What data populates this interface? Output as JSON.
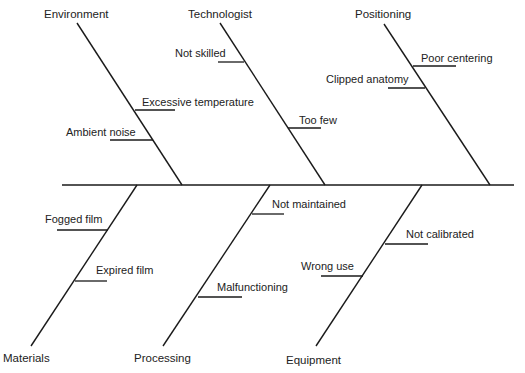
{
  "diagram": {
    "type": "fishbone",
    "line_color": "#1a1a1a",
    "spine": {
      "x1": 62,
      "y1": 185,
      "x2": 514,
      "y2": 185
    },
    "categories": [
      {
        "id": "environment",
        "label": "Environment",
        "side": "top",
        "label_pos": {
          "x": 44,
          "y": 8
        },
        "rib": {
          "x1": 77,
          "y1": 23,
          "x2": 182,
          "y2": 185
        },
        "causes": [
          {
            "label": "Excessive temperature",
            "label_pos": {
              "x": 142,
              "y": 96
            },
            "line": {
              "x1": 135,
              "y1": 110,
              "x2": 175,
              "y2": 110
            }
          },
          {
            "label": "Ambient noise",
            "label_pos": {
              "x": 66,
              "y": 126
            },
            "line": {
              "x1": 110,
              "y1": 140,
              "x2": 153,
              "y2": 140
            }
          }
        ]
      },
      {
        "id": "technologist",
        "label": "Technologist",
        "side": "top",
        "label_pos": {
          "x": 188,
          "y": 8
        },
        "rib": {
          "x1": 220,
          "y1": 23,
          "x2": 325,
          "y2": 185
        },
        "causes": [
          {
            "label": "Not skilled",
            "label_pos": {
              "x": 175,
              "y": 47
            },
            "line": {
              "x1": 218,
              "y1": 62,
              "x2": 244,
              "y2": 62
            }
          },
          {
            "label": "Too few",
            "label_pos": {
              "x": 299,
              "y": 114
            },
            "line": {
              "x1": 288,
              "y1": 128,
              "x2": 321,
              "y2": 128
            }
          }
        ]
      },
      {
        "id": "positioning",
        "label": "Positioning",
        "side": "top",
        "label_pos": {
          "x": 355,
          "y": 8
        },
        "rib": {
          "x1": 384,
          "y1": 24,
          "x2": 490,
          "y2": 185
        },
        "causes": [
          {
            "label": "Poor centering",
            "label_pos": {
              "x": 421,
              "y": 52
            },
            "line": {
              "x1": 413,
              "y1": 66,
              "x2": 456,
              "y2": 66
            }
          },
          {
            "label": "Clipped anatomy",
            "label_pos": {
              "x": 326,
              "y": 73
            },
            "line": {
              "x1": 388,
              "y1": 88,
              "x2": 425,
              "y2": 88
            }
          }
        ]
      },
      {
        "id": "materials",
        "label": "Materials",
        "side": "bottom",
        "label_pos": {
          "x": 3,
          "y": 352
        },
        "rib": {
          "x1": 137,
          "y1": 185,
          "x2": 31,
          "y2": 346
        },
        "causes": [
          {
            "label": "Fogged film",
            "label_pos": {
              "x": 45,
              "y": 213
            },
            "line": {
              "x1": 57,
              "y1": 230,
              "x2": 108,
              "y2": 230
            }
          },
          {
            "label": "Expired film",
            "label_pos": {
              "x": 96,
              "y": 264
            },
            "line": {
              "x1": 75,
              "y1": 281,
              "x2": 107,
              "y2": 281
            }
          }
        ]
      },
      {
        "id": "processing",
        "label": "Processing",
        "side": "bottom",
        "label_pos": {
          "x": 134,
          "y": 352
        },
        "rib": {
          "x1": 270,
          "y1": 185,
          "x2": 163,
          "y2": 346
        },
        "causes": [
          {
            "label": "Not maintained",
            "label_pos": {
              "x": 272,
              "y": 198
            },
            "line": {
              "x1": 252,
              "y1": 214,
              "x2": 284,
              "y2": 214
            }
          },
          {
            "label": "Malfunctioning",
            "label_pos": {
              "x": 217,
              "y": 281
            },
            "line": {
              "x1": 198,
              "y1": 297,
              "x2": 242,
              "y2": 297
            }
          }
        ]
      },
      {
        "id": "equipment",
        "label": "Equipment",
        "side": "bottom",
        "label_pos": {
          "x": 286,
          "y": 354
        },
        "rib": {
          "x1": 422,
          "y1": 185,
          "x2": 316,
          "y2": 346
        },
        "causes": [
          {
            "label": "Not calibrated",
            "label_pos": {
              "x": 406,
              "y": 228
            },
            "line": {
              "x1": 385,
              "y1": 244,
              "x2": 428,
              "y2": 244
            }
          },
          {
            "label": "Wrong use",
            "label_pos": {
              "x": 301,
              "y": 260
            },
            "line": {
              "x1": 321,
              "y1": 276,
              "x2": 363,
              "y2": 276
            }
          }
        ]
      }
    ]
  }
}
